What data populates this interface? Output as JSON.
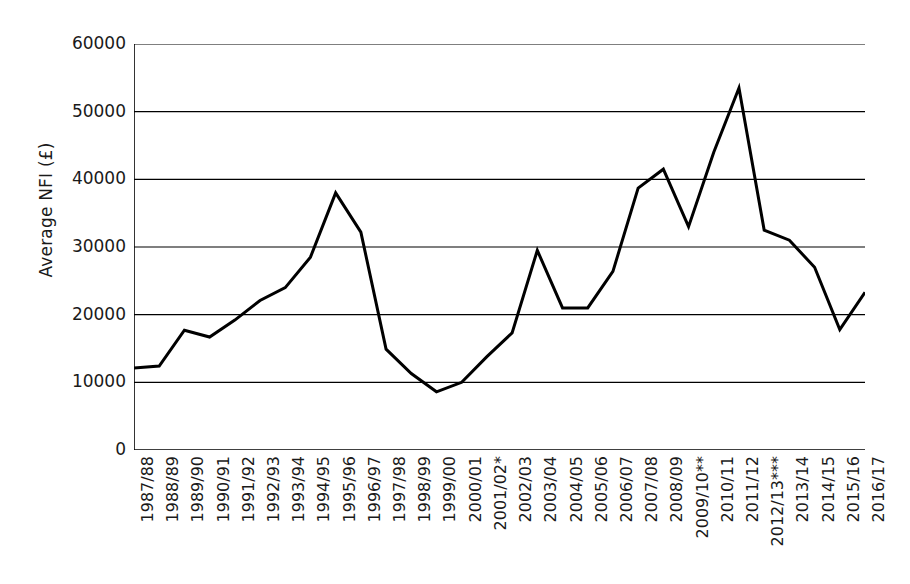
{
  "chart_data": {
    "type": "line",
    "title": "",
    "subtitle": "",
    "xlabel": "",
    "ylabel": "Average NFI (£)",
    "ylim": [
      0,
      60000
    ],
    "ytick_labels": [
      "0",
      "10000",
      "20000",
      "30000",
      "40000",
      "50000",
      "60000"
    ],
    "ytick_values": [
      0,
      10000,
      20000,
      30000,
      40000,
      50000,
      60000
    ],
    "grid": true,
    "grid_axis": "y",
    "legend": false,
    "legend_position": "none",
    "line_color": "#000000",
    "line_width": 3,
    "categories": [
      "1987/88",
      "1988/89",
      "1989/90",
      "1990/91",
      "1991/92",
      "1992/93",
      "1993/94",
      "1994/95",
      "1995/96",
      "1996/97",
      "1997/98",
      "1998/99",
      "1999/00",
      "2000/01",
      "2001/02*",
      "2002/03",
      "2003/04",
      "2004/05",
      "2005/06",
      "2006/07",
      "2007/08",
      "2008/09",
      "2009/10**",
      "2010/11",
      "2011/12",
      "2012/13***",
      "2013/14",
      "2014/15",
      "2015/16",
      "2016/17"
    ],
    "values": [
      12100,
      12400,
      17700,
      16700,
      19200,
      22100,
      24000,
      28500,
      38000,
      32200,
      14900,
      11300,
      8600,
      10000,
      13800,
      17300,
      29500,
      21000,
      21000,
      26400,
      38700,
      41500,
      33000,
      44000,
      53500,
      32500,
      31000,
      27000,
      17800,
      23300
    ],
    "series": [
      {
        "name": "Average NFI",
        "values": [
          12100,
          12400,
          17700,
          16700,
          19200,
          22100,
          24000,
          28500,
          38000,
          32200,
          14900,
          11300,
          8600,
          10000,
          13800,
          17300,
          29500,
          21000,
          21000,
          26400,
          38700,
          41500,
          33000,
          44000,
          53500,
          32500,
          31000,
          27000,
          17800,
          23300
        ]
      }
    ],
    "annotations": []
  }
}
